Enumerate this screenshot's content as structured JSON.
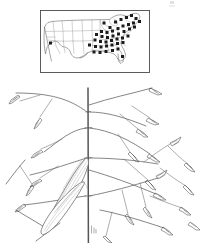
{
  "plate": {
    "width": 207,
    "height": 243,
    "background_color": "#ffffff",
    "ink_color": "#4a4a4a",
    "dot_color": "#1c1c1c"
  },
  "distribution_map": {
    "name": "United States distribution map",
    "frame": {
      "x": 40,
      "y": 10,
      "width": 110,
      "height": 63
    },
    "outline_color": "#6f6f6f",
    "state_border_color": "#9a9a9a",
    "symbol": "filled-square-dot",
    "dot_radius": 1.5,
    "occurrence_count": 44,
    "occurrence_dots": [
      {
        "x": 50.5,
        "y": 43.0
      },
      {
        "x": 104.0,
        "y": 23.0
      },
      {
        "x": 110.0,
        "y": 27.5
      },
      {
        "x": 115.5,
        "y": 22.0
      },
      {
        "x": 121.0,
        "y": 19.5
      },
      {
        "x": 126.5,
        "y": 17.5
      },
      {
        "x": 131.5,
        "y": 15.5
      },
      {
        "x": 136.0,
        "y": 18.5
      },
      {
        "x": 139.5,
        "y": 21.5
      },
      {
        "x": 133.5,
        "y": 23.0
      },
      {
        "x": 128.5,
        "y": 24.5
      },
      {
        "x": 123.0,
        "y": 26.0
      },
      {
        "x": 118.0,
        "y": 28.5
      },
      {
        "x": 112.5,
        "y": 31.0
      },
      {
        "x": 107.0,
        "y": 32.5
      },
      {
        "x": 101.5,
        "y": 31.5
      },
      {
        "x": 96.5,
        "y": 34.5
      },
      {
        "x": 102.0,
        "y": 36.5
      },
      {
        "x": 107.5,
        "y": 37.5
      },
      {
        "x": 113.0,
        "y": 36.0
      },
      {
        "x": 118.5,
        "y": 34.0
      },
      {
        "x": 124.0,
        "y": 31.5
      },
      {
        "x": 129.5,
        "y": 29.0
      },
      {
        "x": 134.5,
        "y": 27.0
      },
      {
        "x": 95.0,
        "y": 40.0
      },
      {
        "x": 100.5,
        "y": 41.5
      },
      {
        "x": 106.0,
        "y": 42.0
      },
      {
        "x": 111.5,
        "y": 40.5
      },
      {
        "x": 117.0,
        "y": 39.0
      },
      {
        "x": 122.5,
        "y": 38.0
      },
      {
        "x": 128.0,
        "y": 36.0
      },
      {
        "x": 89.5,
        "y": 45.0
      },
      {
        "x": 95.5,
        "y": 46.5
      },
      {
        "x": 101.0,
        "y": 47.0
      },
      {
        "x": 106.5,
        "y": 46.0
      },
      {
        "x": 112.0,
        "y": 45.0
      },
      {
        "x": 117.5,
        "y": 43.5
      },
      {
        "x": 123.0,
        "y": 42.5
      },
      {
        "x": 94.0,
        "y": 52.0
      },
      {
        "x": 100.0,
        "y": 52.5
      },
      {
        "x": 106.0,
        "y": 51.5
      },
      {
        "x": 112.5,
        "y": 50.5
      },
      {
        "x": 118.0,
        "y": 49.0
      },
      {
        "x": 122.5,
        "y": 56.5
      }
    ]
  },
  "plant_illustration": {
    "name": "grass inflorescence line drawing",
    "subject": "grass panicle with culm, leaf blades and spikelets",
    "culm": {
      "label": "central culm",
      "x": 88,
      "y_top": 88,
      "y_bottom": 243,
      "nodes": [
        128,
        158,
        196
      ]
    },
    "scale_mark": {
      "x": 92,
      "y": 228,
      "label": "base tick mark"
    },
    "leaves": [
      {
        "name": "upper leaf blade",
        "tip_x": 86,
        "tip_y": 163
      },
      {
        "name": "lower leaf blade",
        "tip_x": 78,
        "tip_y": 186
      }
    ],
    "panicle_branch_count": 14,
    "spikelet_count": 26
  }
}
